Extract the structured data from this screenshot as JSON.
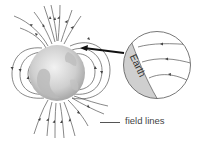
{
  "diagram": {
    "labels": {
      "earth": "Earth",
      "field_lines": "field lines"
    },
    "colors": {
      "line": "#555555",
      "globe_light": "#e6e6e6",
      "globe_dark": "#9a9a9a",
      "crescent": "#cfcfcf",
      "arrow": "#111111"
    },
    "elements": [
      {
        "name": "globe",
        "description": "Grey globe representing Earth with field lines emerging from poles"
      },
      {
        "name": "magnified-view",
        "description": "Circular inset showing field lines entering Earth's surface"
      },
      {
        "name": "pointer-arrow",
        "description": "Thick black arrow from inset to globe surface"
      }
    ]
  }
}
